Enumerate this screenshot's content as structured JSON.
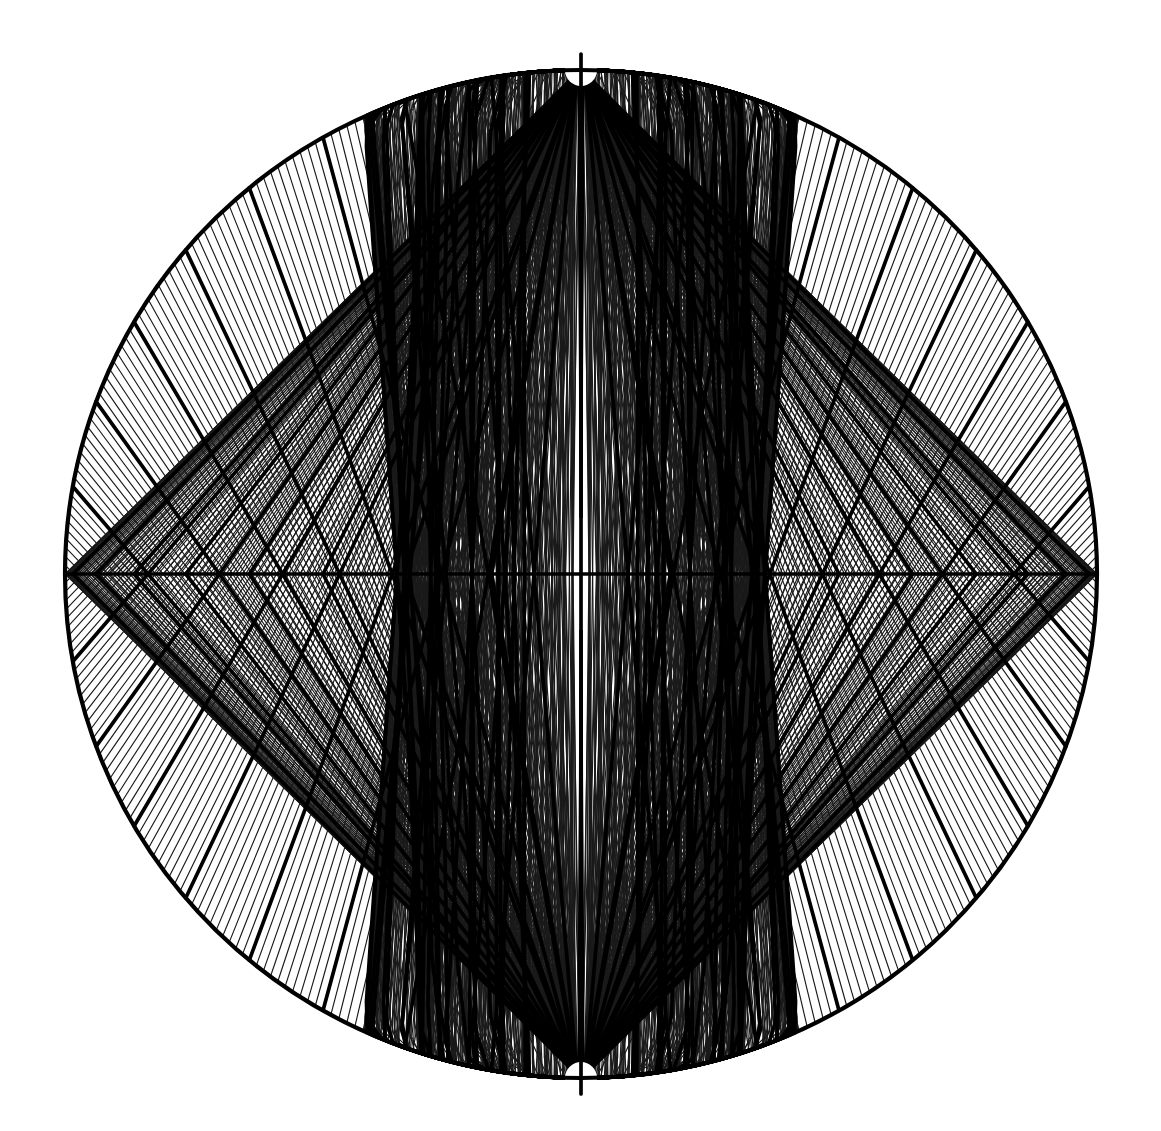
{
  "figure": {
    "type": "globular-projection-graticule",
    "background_color": "#ffffff",
    "line_color": "#1a1a1a",
    "major_line_color": "#000000"
  },
  "chart_data": {
    "type": "line",
    "subtitle": "",
    "xlabel": "Longitude",
    "ylabel": "Latitude",
    "projection": "globular",
    "grid": true,
    "legend_position": "none",
    "xlim": [
      -90,
      90
    ],
    "ylim": [
      -90,
      90
    ],
    "major_step_deg": 10,
    "minor_step_deg": 1,
    "latitude_major_ticks": [
      -90,
      -80,
      -70,
      -60,
      -50,
      -40,
      -30,
      -20,
      -10,
      0,
      10,
      20,
      30,
      40,
      50,
      60,
      70,
      80,
      90
    ],
    "longitude_major_ticks": [
      -90,
      -80,
      -70,
      -60,
      -50,
      -40,
      -30,
      -20,
      -10,
      0,
      10,
      20,
      30,
      40,
      50,
      60,
      70,
      80,
      90
    ],
    "series": [
      {
        "name": "parallels",
        "values": [
          -90,
          -80,
          -70,
          -60,
          -50,
          -40,
          -30,
          -20,
          -10,
          0,
          10,
          20,
          30,
          40,
          50,
          60,
          70,
          80,
          90
        ]
      },
      {
        "name": "meridians",
        "values": [
          -90,
          -80,
          -70,
          -60,
          -50,
          -40,
          -30,
          -20,
          -10,
          0,
          10,
          20,
          30,
          40,
          50,
          60,
          70,
          80,
          90
        ]
      }
    ],
    "annotations": [
      {
        "label": "North Pole",
        "lat": 90,
        "lon": 0
      },
      {
        "label": "South Pole",
        "lat": -90,
        "lon": 0
      },
      {
        "label": "Equator",
        "lat": 0,
        "lon": 0
      },
      {
        "label": "Prime Meridian",
        "lat": 0,
        "lon": 0
      }
    ]
  },
  "geometry": {
    "center_x": 581,
    "center_y": 574,
    "radius_x": 516,
    "radius_y": 504,
    "pole_cap_radius": 16,
    "minor_line_width": 1.15,
    "major_line_width": 3.7,
    "limb_line_width": 4.2
  }
}
